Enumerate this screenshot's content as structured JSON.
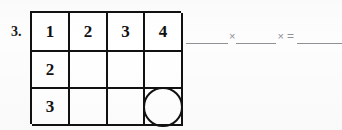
{
  "worksheet": {
    "problem_number": "3.",
    "grid": {
      "columns": 4,
      "rows": 3,
      "cells": [
        [
          {
            "value": "1",
            "empty": false,
            "circled": false
          },
          {
            "value": "2",
            "empty": false,
            "circled": false
          },
          {
            "value": "3",
            "empty": false,
            "circled": false
          },
          {
            "value": "4",
            "empty": false,
            "circled": false
          }
        ],
        [
          {
            "value": "2",
            "empty": false,
            "circled": false
          },
          {
            "value": "",
            "empty": true,
            "circled": false
          },
          {
            "value": "",
            "empty": true,
            "circled": false
          },
          {
            "value": "",
            "empty": true,
            "circled": false
          }
        ],
        [
          {
            "value": "3",
            "empty": false,
            "circled": false
          },
          {
            "value": "",
            "empty": true,
            "circled": false
          },
          {
            "value": "",
            "empty": true,
            "circled": false
          },
          {
            "value": "",
            "empty": true,
            "circled": true
          }
        ]
      ]
    },
    "equation": {
      "blank1": "",
      "operator1": "×",
      "blank2": "",
      "operator2": "×",
      "equals": "=",
      "blank3": ""
    },
    "colors": {
      "ink": "#111111",
      "blank_rule": "#8e9196",
      "paper": "#fdfdfd"
    }
  }
}
